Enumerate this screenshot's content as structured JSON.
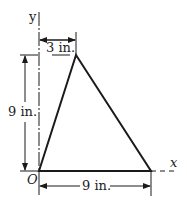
{
  "figure": {
    "axis_x_label": "x",
    "axis_y_label": "y",
    "origin_label": "O",
    "dim_top": "3 in.",
    "dim_left": "9 in.",
    "dim_bottom": "9 in.",
    "line_color": "#1a1a1a"
  }
}
